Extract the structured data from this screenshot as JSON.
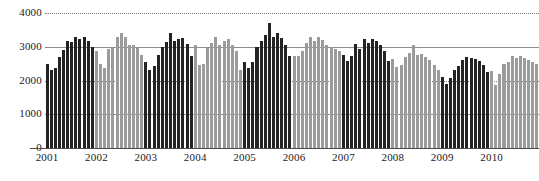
{
  "chart_data": {
    "type": "bar",
    "title": "",
    "subtitle": "",
    "xlabel": "",
    "ylabel": "",
    "ylim": [
      0,
      4000
    ],
    "ytick_labels": [
      "0",
      "1000",
      "2000",
      "3000",
      "4000"
    ],
    "ytick_values": [
      0,
      1000,
      2000,
      3000,
      4000
    ],
    "xtick_labels": [
      "2001",
      "2002",
      "2003",
      "2004",
      "2005",
      "2006",
      "2007",
      "2008",
      "2009",
      "2010"
    ],
    "grid": true,
    "legend": "none",
    "bar_colors": {
      "dark": "#232323",
      "light": "#9b9b9b"
    },
    "note": "Monthly series, alternating shading per calendar year (dark = odd years starting 2001, light = even years).",
    "groups": [
      {
        "year": "2001",
        "shade": "dark",
        "values": [
          2500,
          2320,
          2360,
          2700,
          2900,
          3180,
          3140,
          3280,
          3240,
          3280,
          3160,
          2980
        ]
      },
      {
        "year": "2002",
        "shade": "light",
        "values": [
          2880,
          2480,
          2360,
          2920,
          2960,
          3280,
          3420,
          3280,
          3040,
          3060,
          2960,
          2760
        ]
      },
      {
        "year": "2003",
        "shade": "dark",
        "values": [
          2540,
          2300,
          2440,
          2760,
          3000,
          3140,
          3400,
          3160,
          3240,
          3260,
          3080,
          2740
        ]
      },
      {
        "year": "2004",
        "shade": "light",
        "values": [
          3060,
          2460,
          2480,
          2960,
          3120,
          3300,
          3060,
          3160,
          3240,
          3060,
          2880,
          2300
        ]
      },
      {
        "year": "2005",
        "shade": "dark",
        "values": [
          2560,
          2380,
          2540,
          2980,
          3180,
          3360,
          3700,
          3280,
          3400,
          3260,
          3040,
          2720
        ]
      },
      {
        "year": "2006",
        "shade": "light",
        "values": [
          2740,
          2720,
          2860,
          3120,
          3300,
          3180,
          3280,
          3200,
          3060,
          3000,
          2920,
          2880
        ]
      },
      {
        "year": "2007",
        "shade": "dark",
        "values": [
          2760,
          2580,
          2720,
          3080,
          2940,
          3240,
          3120,
          3220,
          3180,
          3040,
          2880,
          2580
        ]
      },
      {
        "year": "2008",
        "shade": "light",
        "values": [
          2640,
          2400,
          2460,
          2700,
          2820,
          3060,
          2760,
          2780,
          2700,
          2600,
          2460,
          2320
        ]
      },
      {
        "year": "2009",
        "shade": "dark",
        "values": [
          2100,
          1900,
          2060,
          2300,
          2440,
          2620,
          2700,
          2680,
          2640,
          2580,
          2460,
          2260
        ]
      },
      {
        "year": "2010",
        "shade": "light",
        "values": [
          2280,
          1880,
          2180,
          2500,
          2560,
          2740,
          2680,
          2720,
          2660,
          2600,
          2560,
          2480
        ]
      }
    ]
  }
}
